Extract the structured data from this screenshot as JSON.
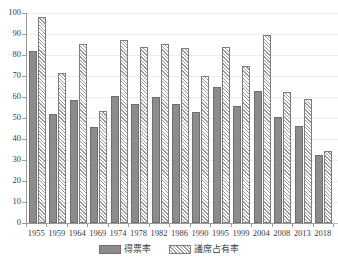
{
  "chart_data": {
    "type": "bar",
    "title": "",
    "subtitle": "",
    "xlabel": "",
    "ylabel": "",
    "ylim": [
      0,
      100
    ],
    "ytick_step": 10,
    "yticks": [
      0,
      10,
      20,
      30,
      40,
      50,
      60,
      70,
      80,
      90,
      100
    ],
    "grid": true,
    "grid_axis": "y",
    "legend_position": "bottom-center",
    "categories": [
      "1955",
      "1959",
      "1964",
      "1969",
      "1974",
      "1978",
      "1982",
      "1986",
      "1990",
      "1995",
      "1999",
      "2004",
      "2008",
      "2013",
      "2018"
    ],
    "series": [
      {
        "name": "得票率",
        "style": "solid-gray",
        "color": "#8c8c8c",
        "values": [
          81.8,
          51.8,
          58.5,
          45.8,
          60.5,
          56.8,
          60.2,
          56.8,
          53.0,
          64.7,
          55.9,
          63.0,
          50.6,
          46.3,
          32.3
        ]
      },
      {
        "name": "議席占有率",
        "style": "diagonal-hatch",
        "color": "#9a9a9a",
        "values": [
          97.9,
          71.2,
          85.4,
          53.3,
          87.3,
          84.0,
          85.2,
          83.2,
          70.0,
          83.8,
          74.6,
          89.6,
          62.3,
          58.9,
          34.3
        ]
      }
    ]
  },
  "legend": {
    "entries": [
      {
        "label": "得票率"
      },
      {
        "label": "議席占有率"
      }
    ]
  },
  "colors": {
    "votes_fill": "#8c8c8c",
    "seats_hatch": "#9a9a9a",
    "axis": "#9a9a9a",
    "gridline": "#ececec",
    "text": "#3b3b3b",
    "background": "#ffffff"
  }
}
